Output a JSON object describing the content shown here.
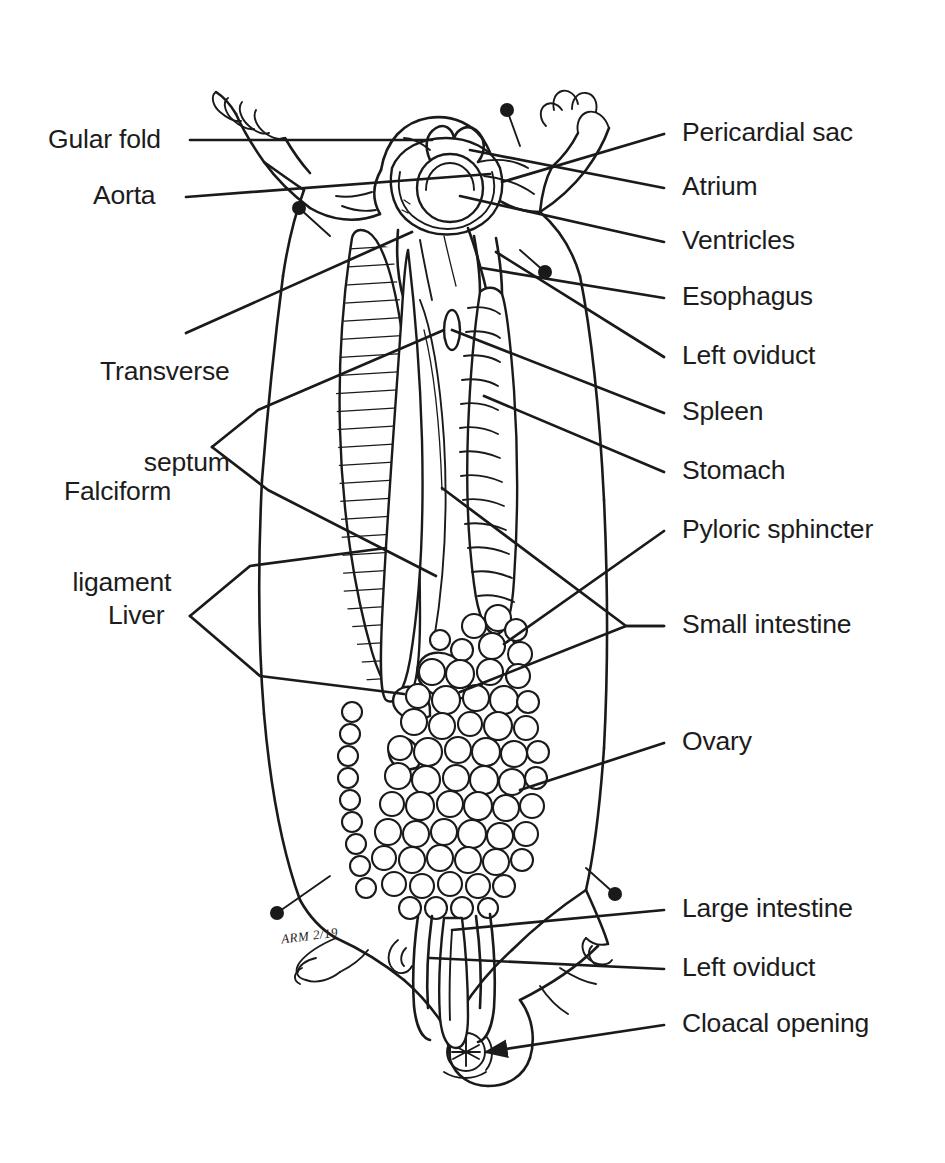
{
  "figure": {
    "kind": "anatomical-line-drawing",
    "background_color": "#ffffff",
    "ink_color": "#1a1a1a",
    "width": 945,
    "height": 1163
  },
  "labels_left": [
    {
      "id": "gular-fold",
      "text": "Gular fold",
      "lines": [
        "Gular fold"
      ],
      "x": 48,
      "y": 124,
      "leader": "straight"
    },
    {
      "id": "aorta",
      "text": "Aorta",
      "lines": [
        "Aorta"
      ],
      "x": 93,
      "y": 180,
      "leader": "straight"
    },
    {
      "id": "transverse-septum",
      "text": "Transverse septum",
      "lines": [
        "Transverse",
        "septum"
      ],
      "x": 100,
      "y": 296,
      "leader": "straight"
    },
    {
      "id": "falciform-ligament",
      "text": "Falciform ligament",
      "lines": [
        "Falciform",
        "ligament"
      ],
      "x": 64,
      "y": 416,
      "leader": "bracket"
    },
    {
      "id": "liver",
      "text": "Liver",
      "lines": [
        "Liver"
      ],
      "x": 108,
      "y": 600,
      "leader": "bracket"
    }
  ],
  "labels_right": [
    {
      "id": "pericardial-sac",
      "text": "Pericardial sac",
      "x": 682,
      "y": 117,
      "leader": "straight"
    },
    {
      "id": "atrium",
      "text": "Atrium",
      "x": 682,
      "y": 171,
      "leader": "straight"
    },
    {
      "id": "ventricles",
      "text": "Ventricles",
      "x": 682,
      "y": 225,
      "leader": "straight"
    },
    {
      "id": "esophagus",
      "text": "Esophagus",
      "x": 682,
      "y": 281,
      "leader": "straight"
    },
    {
      "id": "left-oviduct-upper",
      "text": "Left oviduct",
      "x": 682,
      "y": 340,
      "leader": "straight"
    },
    {
      "id": "spleen",
      "text": "Spleen",
      "x": 682,
      "y": 396,
      "leader": "straight"
    },
    {
      "id": "stomach",
      "text": "Stomach",
      "x": 682,
      "y": 455,
      "leader": "straight"
    },
    {
      "id": "pyloric-sphincter",
      "text": "Pyloric sphincter",
      "x": 682,
      "y": 514,
      "leader": "straight"
    },
    {
      "id": "small-intestine",
      "text": "Small intestine",
      "x": 682,
      "y": 609,
      "leader": "bracket"
    },
    {
      "id": "ovary",
      "text": "Ovary",
      "x": 682,
      "y": 726,
      "leader": "straight"
    },
    {
      "id": "large-intestine",
      "text": "Large intestine",
      "x": 682,
      "y": 893,
      "leader": "straight"
    },
    {
      "id": "left-oviduct-lower",
      "text": "Left oviduct",
      "x": 682,
      "y": 952,
      "leader": "straight"
    },
    {
      "id": "cloacal-opening",
      "text": "Cloacal opening",
      "x": 682,
      "y": 1008,
      "leader": "arrow"
    }
  ],
  "handwriting": [
    {
      "id": "student-initials",
      "text": "ARM 2/19",
      "x": 281,
      "y": 928
    }
  ],
  "structures": [
    {
      "id": "gular-fold-structure",
      "name": "Gular fold"
    },
    {
      "id": "aorta-structure",
      "name": "Aorta"
    },
    {
      "id": "pericardial-sac-structure",
      "name": "Pericardial sac"
    },
    {
      "id": "atrium-structure",
      "name": "Atrium"
    },
    {
      "id": "ventricles-structure",
      "name": "Ventricles"
    },
    {
      "id": "esophagus-structure",
      "name": "Esophagus"
    },
    {
      "id": "transverse-septum-structure",
      "name": "Transverse septum"
    },
    {
      "id": "falciform-ligament-structure",
      "name": "Falciform ligament"
    },
    {
      "id": "liver-structure",
      "name": "Liver"
    },
    {
      "id": "spleen-structure",
      "name": "Spleen"
    },
    {
      "id": "stomach-structure",
      "name": "Stomach"
    },
    {
      "id": "pyloric-sphincter-structure",
      "name": "Pyloric sphincter"
    },
    {
      "id": "small-intestine-structure",
      "name": "Small intestine"
    },
    {
      "id": "large-intestine-structure",
      "name": "Large intestine"
    },
    {
      "id": "ovary-structure",
      "name": "Ovary"
    },
    {
      "id": "left-oviduct-structure",
      "name": "Left oviduct"
    },
    {
      "id": "cloacal-opening-structure",
      "name": "Cloacal opening"
    }
  ]
}
